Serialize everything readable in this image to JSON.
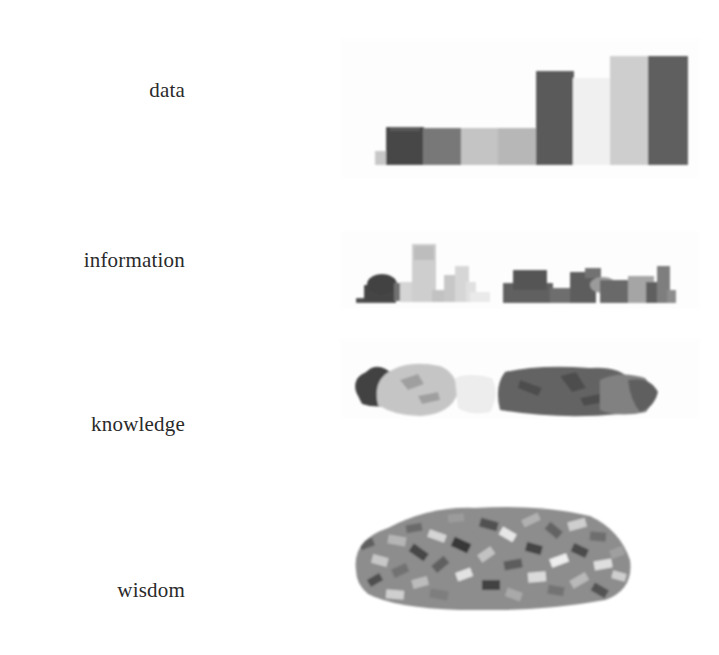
{
  "diagram": {
    "title": "",
    "stages": [
      {
        "id": "data",
        "label": "data"
      },
      {
        "id": "information",
        "label": "information"
      },
      {
        "id": "knowledge",
        "label": "knowledge"
      },
      {
        "id": "wisdom",
        "label": "wisdom"
      }
    ],
    "colors": {
      "dark": "#4a4a4a",
      "mid_dark": "#5e5e5e",
      "mid": "#7d7d7d",
      "light": "#b9b9b9",
      "pale": "#d4d4d4",
      "faint": "#ececec",
      "text": "#2a2a2a"
    }
  }
}
